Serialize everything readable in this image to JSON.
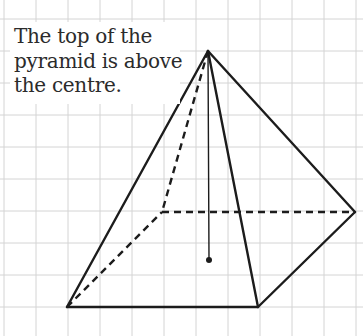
{
  "caption": {
    "lines": [
      "The top of the",
      "pyramid is above",
      "the centre."
    ]
  },
  "grid": {
    "spacing": 32,
    "x_lines": [
      4,
      36,
      68,
      100,
      132,
      164,
      196,
      228,
      260,
      292,
      324,
      356
    ],
    "y_lines": [
      19,
      51,
      83,
      115,
      147,
      179,
      211,
      243,
      275,
      307
    ],
    "color": "#d4d4d4"
  },
  "pyramid": {
    "apex": [
      208,
      51
    ],
    "base_front_left": [
      67,
      307
    ],
    "base_front_right": [
      258,
      307
    ],
    "base_back_right": [
      355,
      212
    ],
    "base_back_left": [
      162,
      212
    ],
    "centre": [
      209,
      260
    ],
    "edge_color": "#1c1c1c",
    "hidden_edge_style": "dashed"
  }
}
